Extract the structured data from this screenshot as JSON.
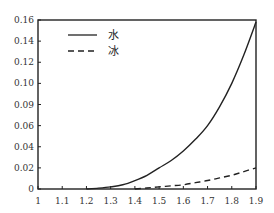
{
  "chart_data": {
    "type": "line",
    "title": "",
    "xlabel": "",
    "ylabel": "",
    "xlim": [
      1,
      1.9
    ],
    "ylim": [
      0,
      0.16
    ],
    "grid": false,
    "legend_position": "upper-left",
    "x_ticks": [
      "1",
      "1.1",
      "1.2",
      "1.3",
      "1.4",
      "1.5",
      "1.6",
      "1.7",
      "1.8",
      "1.9"
    ],
    "y_ticks": [
      "0",
      "0.02",
      "0.04",
      "0.06",
      "0.09",
      "0.10",
      "0.12",
      "0.14",
      "0.16"
    ],
    "x": [
      1.2,
      1.25,
      1.3,
      1.35,
      1.4,
      1.45,
      1.5,
      1.55,
      1.6,
      1.65,
      1.7,
      1.75,
      1.8,
      1.85,
      1.9
    ],
    "series": [
      {
        "name": "水",
        "style": "solid",
        "values": [
          0,
          0.0008,
          0.002,
          0.004,
          0.008,
          0.013,
          0.02,
          0.027,
          0.036,
          0.047,
          0.06,
          0.078,
          0.1,
          0.127,
          0.158
        ]
      },
      {
        "name": "冰",
        "style": "dashed",
        "values": [
          null,
          null,
          null,
          null,
          0,
          0.001,
          0.002,
          0.003,
          0.004,
          0.006,
          0.008,
          0.0105,
          0.013,
          0.0165,
          0.02
        ]
      }
    ]
  },
  "legend": {
    "items": [
      {
        "label": "水",
        "style": "solid"
      },
      {
        "label": "冰",
        "style": "dashed"
      }
    ]
  }
}
